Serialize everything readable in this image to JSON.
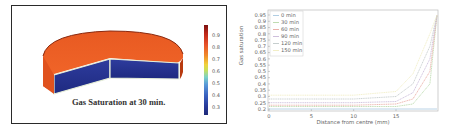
{
  "left_figure": {
    "title": "Gas Saturation at 30 min.",
    "colorbar": {
      "ticks": [
        "0.9",
        "0.8",
        "0.7",
        "0.6",
        "0.5",
        "0.4",
        "0.3"
      ],
      "colors": {
        "top": "#7a1010",
        "high": "#e8522a",
        "mid": "#f0d23a",
        "low": "#3a62c0",
        "bottom": "#1e2a78"
      }
    },
    "cylinder_colors": {
      "top_face": "#ec5a22",
      "cut_face": "#26339a",
      "rim": "#d9e6c8"
    }
  },
  "chart_data": {
    "type": "line",
    "title": "",
    "xlabel": "Distance from centre (mm)",
    "ylabel": "Gas saturation",
    "xlim": [
      0,
      20
    ],
    "ylim": [
      0.2,
      0.97
    ],
    "xticks": [
      "0",
      "5",
      "10",
      "15"
    ],
    "yticks": [
      "0.95",
      "0.9",
      "0.85",
      "0.8",
      "0.75",
      "0.7",
      "0.65",
      "0.6",
      "0.55",
      "0.5",
      "0.45",
      "0.4",
      "0.35",
      "0.3",
      "0.25",
      "0.2"
    ],
    "grid": false,
    "legend_position": "upper left",
    "series": [
      {
        "name": "0 min",
        "color": "#a8c8e0",
        "x": [
          0,
          5,
          10,
          15,
          17,
          19,
          20
        ],
        "values": [
          0.2,
          0.2,
          0.2,
          0.2,
          0.2,
          0.2,
          0.2
        ]
      },
      {
        "name": "30 min",
        "color": "#b8d8a8",
        "x": [
          0,
          5,
          10,
          15,
          17,
          19,
          20
        ],
        "values": [
          0.22,
          0.22,
          0.22,
          0.22,
          0.24,
          0.4,
          0.95
        ]
      },
      {
        "name": "60 min",
        "color": "#e8a8a0",
        "x": [
          0,
          5,
          10,
          15,
          17,
          19,
          20
        ],
        "values": [
          0.23,
          0.23,
          0.23,
          0.24,
          0.28,
          0.5,
          0.95
        ]
      },
      {
        "name": "90 min",
        "color": "#c8b8d8",
        "x": [
          0,
          5,
          10,
          15,
          17,
          19,
          20
        ],
        "values": [
          0.25,
          0.25,
          0.25,
          0.26,
          0.33,
          0.6,
          0.95
        ]
      },
      {
        "name": "120 min",
        "color": "#c0c8c8",
        "x": [
          0,
          5,
          10,
          15,
          17,
          19,
          20
        ],
        "values": [
          0.28,
          0.28,
          0.28,
          0.3,
          0.4,
          0.7,
          0.95
        ]
      },
      {
        "name": "150 min",
        "color": "#f0ecc0",
        "x": [
          0,
          5,
          10,
          15,
          17,
          19,
          20
        ],
        "values": [
          0.31,
          0.31,
          0.31,
          0.34,
          0.48,
          0.8,
          0.95
        ]
      }
    ]
  }
}
